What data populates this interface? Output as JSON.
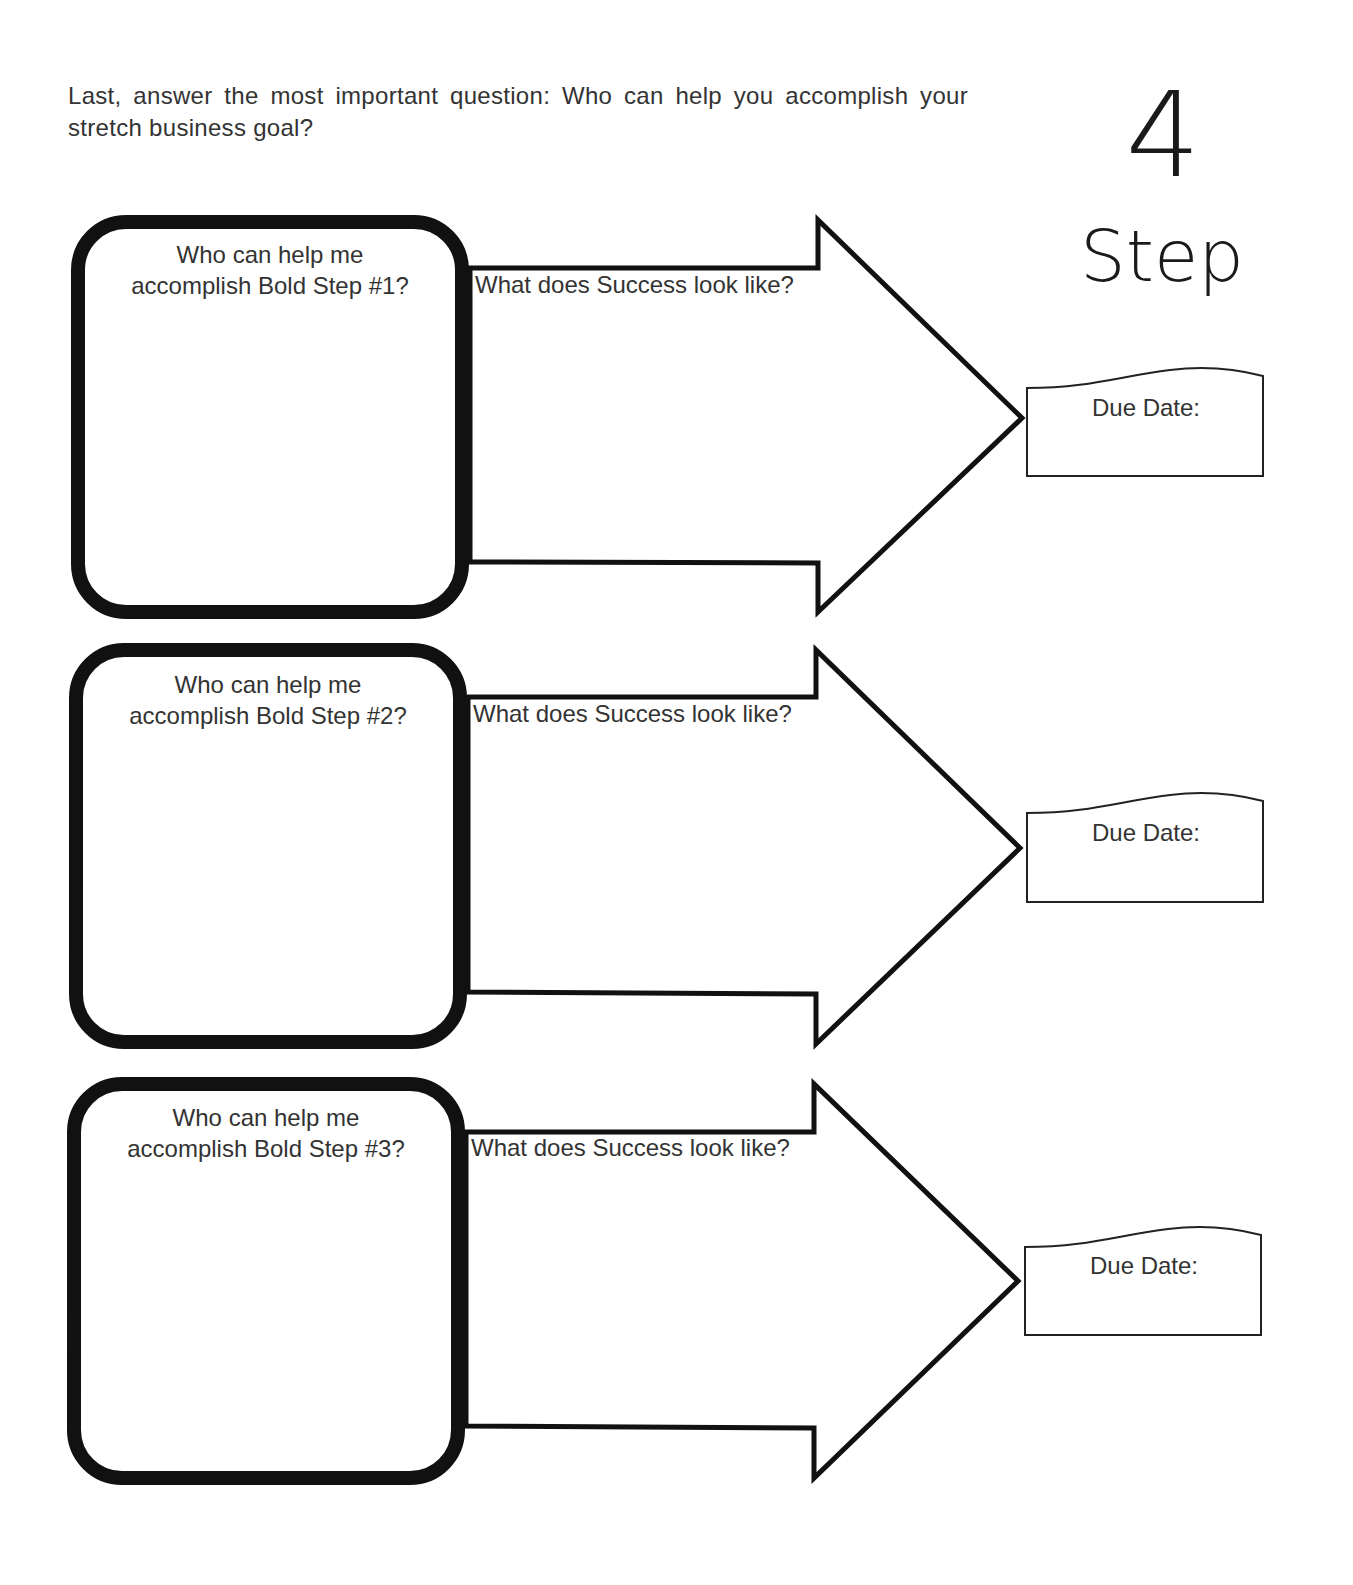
{
  "intro": {
    "text": "Last, answer the most important question: Who can help you accomplish your stretch business goal?"
  },
  "step_badge": {
    "number": "4",
    "word": "Step"
  },
  "rows": [
    {
      "who_line1": "Who can help me",
      "who_line2": "accomplish Bold Step #1?",
      "success_label": "What does Success look like?",
      "due_label": "Due Date:"
    },
    {
      "who_line1": "Who can help me",
      "who_line2": "accomplish Bold Step #2?",
      "success_label": "What does Success look like?",
      "due_label": "Due Date:"
    },
    {
      "who_line1": "Who can help me",
      "who_line2": "accomplish Bold Step #3?",
      "success_label": "What does Success look like?",
      "due_label": "Due Date:"
    }
  ],
  "colors": {
    "ink": "#111111",
    "text": "#333333",
    "paper": "#ffffff"
  }
}
